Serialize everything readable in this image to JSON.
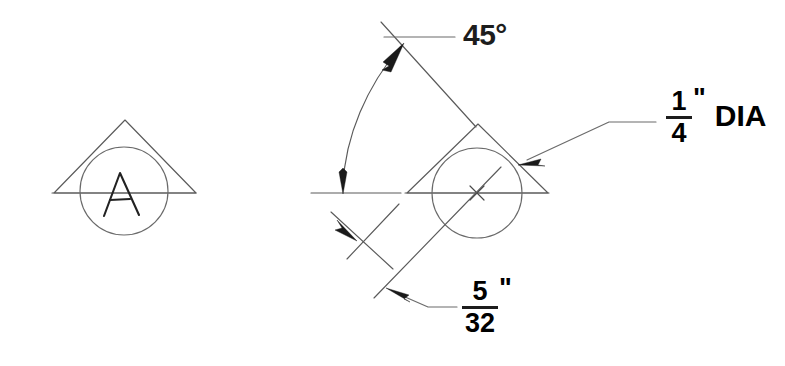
{
  "drawing": {
    "title": "Weld symbol detail drawing",
    "background_color": "#ffffff",
    "line_color": "#5a5a5a",
    "text_color": "#1d1d1d",
    "width": 785,
    "height": 366
  },
  "symbols": [
    {
      "id": "symbol-left",
      "name": "spot-weld-symbol-labeled-A",
      "letter": "A",
      "triangle": {
        "apex_x": 125,
        "apex_y": 120,
        "left_x": 54,
        "left_y": 193,
        "right_x": 196,
        "right_y": 193
      },
      "circle": {
        "cx": 124,
        "cy": 191,
        "r": 44
      },
      "baseline": {
        "x1": 52,
        "y1": 193,
        "x2": 196,
        "y2": 193
      }
    },
    {
      "id": "symbol-right",
      "name": "spot-weld-symbol-dimensioned",
      "letter": "",
      "triangle": {
        "apex_x": 478,
        "apex_y": 124,
        "left_x": 407,
        "left_y": 193,
        "right_x": 548,
        "right_y": 193
      },
      "circle": {
        "cx": 477,
        "cy": 193,
        "r": 45
      },
      "baseline": {
        "x1": 405,
        "y1": 193,
        "x2": 549,
        "y2": 193
      },
      "center_mark": {
        "cx": 477,
        "cy": 193,
        "size": 9
      }
    }
  ],
  "annotations": {
    "angle": {
      "name": "angle-dimension",
      "value": "45",
      "unit": "°",
      "text": "45°",
      "description": "Angle between horizontal reference line and inclined axis",
      "leader": {
        "from_x": 384,
        "from_y": 37,
        "elbow_x": 404,
        "elbow_y": 37,
        "to_x": 455,
        "to_y": 37
      },
      "arc": {
        "start_x": 399,
        "start_y": 42,
        "end_x": 343,
        "end_y": 188,
        "radius": 150
      }
    },
    "diameter": {
      "name": "diameter-callout",
      "numerator": "1",
      "denominator": "4",
      "inch": "\"",
      "suffix": "DIA",
      "text": "1/4\" DIA",
      "description": "Circle diameter callout",
      "leader": {
        "from_x": 521,
        "from_y": 163,
        "elbow_x": 609,
        "elbow_y": 122,
        "to_x": 656,
        "to_y": 122
      }
    },
    "fillet": {
      "name": "fillet-size-dimension",
      "numerator": "5",
      "denominator": "32",
      "inch": "\"",
      "suffix": "",
      "text": "5/32\"",
      "description": "Weld leg size dimension",
      "leader": {
        "from_x": 391,
        "from_y": 291,
        "elbow_x": 428,
        "elbow_y": 307,
        "to_x": 455,
        "to_y": 307
      }
    }
  },
  "reference_geometry": {
    "horizontal_datum": {
      "name": "horizontal-reference-line",
      "x1": 311,
      "y1": 193,
      "x2": 401,
      "y2": 193
    },
    "inclined_axis_upper": {
      "name": "inclined-axis-upper",
      "x1": 381,
      "y1": 22,
      "x2": 475,
      "y2": 126
    },
    "inclined_axis_lower": {
      "name": "inclined-axis-lower",
      "x1": 374,
      "y1": 298,
      "x2": 500,
      "y2": 168
    },
    "offset_line_short": {
      "name": "offset-dimension-line",
      "x1": 331,
      "y1": 213,
      "x2": 392,
      "y2": 268
    },
    "offset_line_extension": {
      "name": "offset-extension-line",
      "x1": 347,
      "y1": 258,
      "x2": 398,
      "y2": 205
    }
  }
}
